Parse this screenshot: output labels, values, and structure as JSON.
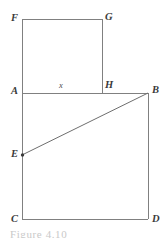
{
  "figure": {
    "caption": "Figure 4.10",
    "stroke_color": "#808080",
    "stroke_width": 1,
    "label_color": "#3a3a3a",
    "background_color": "#ffffff",
    "vertices": {
      "F": {
        "label": "F",
        "x": 22,
        "y": 19
      },
      "G": {
        "label": "G",
        "x": 102,
        "y": 19
      },
      "H": {
        "label": "H",
        "x": 102,
        "y": 93
      },
      "A": {
        "label": "A",
        "x": 22,
        "y": 93
      },
      "B": {
        "label": "B",
        "x": 148,
        "y": 93
      },
      "C": {
        "label": "C",
        "x": 22,
        "y": 219
      },
      "D": {
        "label": "D",
        "x": 148,
        "y": 219
      },
      "E": {
        "label": "E",
        "x": 22,
        "y": 155
      }
    },
    "dimension_labels": [
      {
        "name": "segment-ah-length",
        "text": "x",
        "x": 60,
        "y": 84
      }
    ],
    "segments": [
      {
        "name": "segment-fg",
        "from": "F",
        "to": "G"
      },
      {
        "name": "segment-gh",
        "from": "G",
        "to": "H"
      },
      {
        "name": "segment-fa",
        "from": "F",
        "to": "A"
      },
      {
        "name": "segment-ab",
        "from": "A",
        "to": "B"
      },
      {
        "name": "segment-bd",
        "from": "B",
        "to": "D"
      },
      {
        "name": "segment-cd",
        "from": "C",
        "to": "D"
      },
      {
        "name": "segment-ac",
        "from": "A",
        "to": "C"
      },
      {
        "name": "segment-eb",
        "from": "E",
        "to": "B"
      }
    ],
    "marked_points": [
      {
        "name": "point-e-marker",
        "vertex": "E",
        "radius": 1.6
      }
    ]
  }
}
